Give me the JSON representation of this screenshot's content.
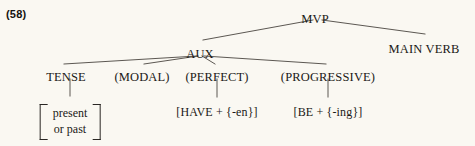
{
  "figure": {
    "example_number": "(58)",
    "background_color": "#faf8f2",
    "line_color": "#4a4540",
    "text_color": "#1b1916"
  },
  "tree": {
    "nodes": {
      "mvp": {
        "label": "MVP",
        "x": 315,
        "y": 12
      },
      "aux": {
        "label": "AUX",
        "x": 200,
        "y": 47
      },
      "main_verb": {
        "label": "MAIN VERB",
        "x": 424,
        "y": 42
      },
      "tense": {
        "label": "TENSE",
        "x": 66,
        "y": 70
      },
      "modal": {
        "label": "(MODAL)",
        "x": 142,
        "y": 70
      },
      "perfect": {
        "label": "(PERFECT)",
        "x": 217,
        "y": 70
      },
      "progressive": {
        "label": "(PROGRESSIVE)",
        "x": 328,
        "y": 70
      },
      "have_en": {
        "label": "[HAVE + {-en}]",
        "x": 217,
        "y": 105
      },
      "be_ing": {
        "label": "[BE + {-ing}]",
        "x": 328,
        "y": 105
      }
    },
    "tense_matrix": {
      "x": 70,
      "y": 104,
      "rows": [
        "present",
        "or past"
      ]
    },
    "edges": [
      {
        "name": "mvp-to-aux",
        "x1": 313,
        "y1": 20,
        "x2": 203,
        "y2": 40
      },
      {
        "name": "mvp-to-main-verb",
        "x1": 322,
        "y1": 20,
        "x2": 425,
        "y2": 34
      },
      {
        "name": "aux-to-tense",
        "x1": 197,
        "y1": 56,
        "x2": 64,
        "y2": 64
      },
      {
        "name": "aux-to-modal",
        "x1": 198,
        "y1": 56,
        "x2": 144,
        "y2": 64
      },
      {
        "name": "aux-to-perfect",
        "x1": 202,
        "y1": 56,
        "x2": 215,
        "y2": 64
      },
      {
        "name": "aux-to-progressive",
        "x1": 204,
        "y1": 56,
        "x2": 326,
        "y2": 64
      },
      {
        "name": "tense-stem",
        "x1": 70,
        "y1": 79,
        "x2": 70,
        "y2": 96
      },
      {
        "name": "perfect-stem",
        "x1": 217,
        "y1": 79,
        "x2": 217,
        "y2": 97
      },
      {
        "name": "progressive-stem",
        "x1": 328,
        "y1": 79,
        "x2": 328,
        "y2": 97
      }
    ]
  }
}
